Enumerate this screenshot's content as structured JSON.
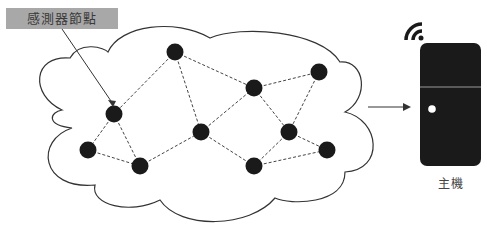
{
  "labels": {
    "sensor_node": "感測器節點",
    "host": "主機"
  },
  "colors": {
    "node": "#1a1a1a",
    "host_body": "#1a1a1a",
    "label_bg": "#a8a8a8",
    "cloud_stroke": "#333333",
    "edge": "#444444"
  },
  "network": {
    "nodes": [
      {
        "id": "A",
        "x": 175,
        "y": 52
      },
      {
        "id": "B",
        "x": 114,
        "y": 114
      },
      {
        "id": "C",
        "x": 88,
        "y": 150
      },
      {
        "id": "D",
        "x": 140,
        "y": 166
      },
      {
        "id": "E",
        "x": 201,
        "y": 132
      },
      {
        "id": "F",
        "x": 254,
        "y": 88
      },
      {
        "id": "G",
        "x": 319,
        "y": 72
      },
      {
        "id": "H",
        "x": 289,
        "y": 132
      },
      {
        "id": "I",
        "x": 254,
        "y": 166
      },
      {
        "id": "J",
        "x": 327,
        "y": 150
      }
    ],
    "edges": [
      [
        "A",
        "B"
      ],
      [
        "A",
        "E"
      ],
      [
        "A",
        "F"
      ],
      [
        "B",
        "C"
      ],
      [
        "B",
        "D"
      ],
      [
        "C",
        "D"
      ],
      [
        "D",
        "E"
      ],
      [
        "E",
        "F"
      ],
      [
        "E",
        "I"
      ],
      [
        "F",
        "G"
      ],
      [
        "F",
        "H"
      ],
      [
        "G",
        "H"
      ],
      [
        "H",
        "I"
      ],
      [
        "H",
        "J"
      ],
      [
        "I",
        "J"
      ]
    ]
  },
  "icons": {
    "wifi": "wifi-icon",
    "host": "server-icon"
  }
}
